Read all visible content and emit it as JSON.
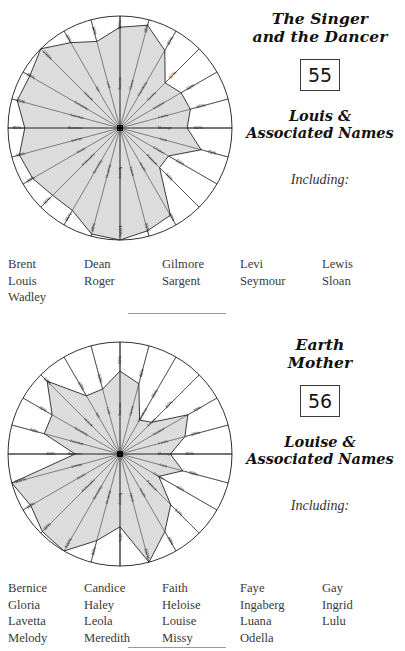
{
  "colors": {
    "ink": "#2a2a2a",
    "outline": "#1a1a1a",
    "fill": "#d6d6d6",
    "rule": "#9a9a9a"
  },
  "spokes": [
    "Success",
    "Career",
    "Friendship",
    "Society",
    "Vocation",
    "Family",
    "Marriage",
    "Love",
    "Children",
    "Pleasure",
    "Health",
    "Talent",
    "Nursery",
    "Dexterity",
    "Sensibility",
    "Philosophy",
    "Acuity",
    "Energy",
    "Business",
    "Journeys",
    "Sociability",
    "Leisure",
    "Wit",
    "Luck"
  ],
  "entries": [
    {
      "title_line1": "The Singer",
      "title_line2": "and the Dancer",
      "number": "55",
      "subtitle_line1": "Louis &",
      "subtitle_line2": "Associated Names",
      "including_label": "Including:",
      "name_columns": [
        [
          "Brent",
          "Louis",
          "Wadley"
        ],
        [
          "Dean",
          "Roger"
        ],
        [
          "Gilmore",
          "Sargent"
        ],
        [
          "Levi",
          "Seymour"
        ],
        [
          "Lewis",
          "Sloan"
        ]
      ],
      "chart_data": {
        "type": "radar",
        "title": "The Singer and the Dancer",
        "categories": [
          "Success",
          "Career",
          "Friendship",
          "Society",
          "Vocation",
          "Family",
          "Marriage",
          "Love",
          "Children",
          "Pleasure",
          "Health",
          "Talent",
          "Nursery",
          "Dexterity",
          "Sensibility",
          "Philosophy",
          "Acuity",
          "Energy",
          "Business",
          "Journeys",
          "Sociability",
          "Leisure",
          "Wit",
          "Luck"
        ],
        "values": [
          90,
          95,
          80,
          57,
          63,
          65,
          60,
          75,
          50,
          50,
          90,
          95,
          100,
          98,
          85,
          85,
          90,
          93,
          85,
          95,
          93,
          100,
          88,
          80
        ],
        "tick_labels": [
          "90%",
          "95%",
          "80%",
          "57%",
          "63%",
          "65%",
          "60%",
          "75%",
          "50%",
          "50%",
          "90%",
          "95%",
          "100%",
          "98%",
          "85%",
          "85%",
          "90%",
          "93%",
          "85%",
          "95%",
          "93%",
          "100%",
          "88%",
          "80%"
        ],
        "ylim": [
          0,
          100
        ],
        "grid": false,
        "legend": "none",
        "value_suffix": "%"
      }
    },
    {
      "title_line1": "Earth",
      "title_line2": "Mother",
      "number": "56",
      "subtitle_line1": "Louise &",
      "subtitle_line2": "Associated Names",
      "including_label": "Including:",
      "name_columns": [
        [
          "Bernice",
          "Gloria",
          "Lavetta",
          "Melody"
        ],
        [
          "Candice",
          "Haley",
          "Leola",
          "Meredith"
        ],
        [
          "Faith",
          "Heloise",
          "Louise",
          "Missy"
        ],
        [
          "Faye",
          "Ingaberg",
          "Luana",
          "Odella"
        ],
        [
          "Gay",
          "Ingrid",
          "Lulu"
        ]
      ],
      "chart_data": {
        "type": "radar",
        "title": "Earth Mother",
        "categories": [
          "Success",
          "Career",
          "Friendship",
          "Society",
          "Vocation",
          "Family",
          "Marriage",
          "Love",
          "Children",
          "Pleasure",
          "Health",
          "Talent",
          "Nursery",
          "Dexterity",
          "Sensibility",
          "Philosophy",
          "Acuity",
          "Energy",
          "Business",
          "Journeys",
          "Sociability",
          "Leisure",
          "Wit",
          "Luck"
        ],
        "values": [
          74,
          65,
          35,
          40,
          70,
          60,
          45,
          58,
          40,
          64,
          80,
          100,
          65,
          80,
          100,
          98,
          92,
          100,
          40,
          70,
          70,
          92,
          60,
          60
        ],
        "tick_labels": [
          "74%",
          "65%",
          "35%",
          "40%",
          "70%",
          "60%",
          "45%",
          "58%",
          "40%",
          "64%",
          "80%",
          "100%",
          "65%",
          "80%",
          "100%",
          "98%",
          "92%",
          "100%",
          "40%",
          "70%",
          "70%",
          "92%",
          "60%",
          "60%"
        ],
        "ylim": [
          0,
          100
        ],
        "grid": false,
        "legend": "none",
        "value_suffix": "%"
      }
    }
  ]
}
